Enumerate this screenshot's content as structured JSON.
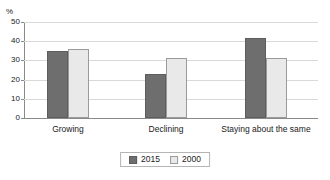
{
  "top_cropped_text": "",
  "axis": {
    "y_unit_label": "%",
    "y_ticks": [
      "0",
      "10",
      "20",
      "30",
      "40",
      "50"
    ]
  },
  "legend": {
    "items": [
      {
        "label": "2015",
        "color": "#6e6e6e"
      },
      {
        "label": "2000",
        "color": "#e9e9e9"
      }
    ]
  },
  "chart_data": {
    "type": "bar",
    "title": "",
    "xlabel": "",
    "ylabel": "%",
    "ylim": [
      0,
      50
    ],
    "ytick_step": 10,
    "grid": true,
    "legend_position": "bottom-center",
    "categories": [
      "Growing",
      "Declining",
      "Staying about the same"
    ],
    "series": [
      {
        "name": "2015",
        "color": "#6e6e6e",
        "values": [
          35,
          23,
          41.5
        ]
      },
      {
        "name": "2000",
        "color": "#e9e9e9",
        "values": [
          36,
          31.5,
          31
        ]
      }
    ]
  }
}
